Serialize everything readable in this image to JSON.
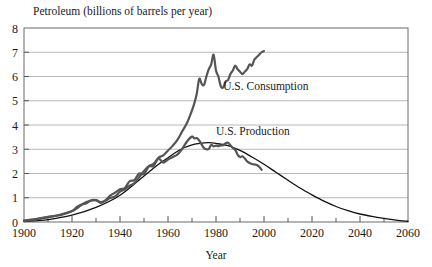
{
  "chart_data": {
    "type": "line",
    "title": "Petroleum (billions of barrels per year)",
    "xlabel": "Year",
    "ylabel": "",
    "xlim": [
      1900,
      2060
    ],
    "ylim": [
      0,
      8
    ],
    "grid": "horizontal",
    "legend_position": "inline-annotations",
    "x_ticks_major": [
      1900,
      1920,
      1940,
      1960,
      1980,
      2000,
      2020,
      2040,
      2060
    ],
    "x_ticks_minor": [
      1910,
      1930,
      1950,
      1970,
      1990,
      2010,
      2030,
      2050
    ],
    "y_ticks": [
      0,
      1,
      2,
      3,
      4,
      5,
      6,
      7,
      8
    ],
    "x_tick_labels": [
      "1900",
      "1920",
      "1940",
      "1960",
      "1980",
      "2000",
      "2020",
      "2040",
      "2060"
    ],
    "y_tick_labels": [
      "0",
      "1",
      "2",
      "3",
      "4",
      "5",
      "6",
      "7",
      "8"
    ],
    "annotations": [
      {
        "text": "U.S. Consumption",
        "x": 1983,
        "y": 5.45
      },
      {
        "text": "U.S. Production",
        "x": 1980,
        "y": 3.6
      }
    ],
    "colors": {
      "consumption": "#555555",
      "production": "#555555",
      "hubbert": "#111111",
      "grid": "#b8b8b8",
      "axis": "#555555",
      "background": "#ffffff"
    },
    "series": [
      {
        "name": "U.S. Consumption",
        "style": "thick-jagged",
        "color": "#555555",
        "x": [
          1900,
          1905,
          1910,
          1915,
          1920,
          1922,
          1924,
          1926,
          1928,
          1930,
          1932,
          1934,
          1936,
          1938,
          1940,
          1942,
          1944,
          1946,
          1948,
          1950,
          1952,
          1954,
          1956,
          1958,
          1960,
          1962,
          1964,
          1966,
          1968,
          1970,
          1971,
          1972,
          1973,
          1974,
          1975,
          1976,
          1977,
          1978,
          1979,
          1980,
          1981,
          1982,
          1983,
          1984,
          1985,
          1986,
          1987,
          1988,
          1989,
          1990,
          1991,
          1992,
          1993,
          1994,
          1995,
          1996,
          1997,
          1998,
          1999,
          2000
        ],
        "y": [
          0.06,
          0.11,
          0.2,
          0.3,
          0.45,
          0.62,
          0.72,
          0.82,
          0.88,
          0.9,
          0.82,
          0.88,
          1.0,
          1.05,
          1.25,
          1.35,
          1.5,
          1.6,
          1.85,
          2.1,
          2.3,
          2.4,
          2.65,
          2.75,
          2.95,
          3.15,
          3.4,
          3.75,
          4.1,
          4.6,
          4.9,
          5.3,
          5.9,
          5.7,
          5.65,
          6.0,
          6.3,
          6.5,
          6.9,
          6.25,
          6.0,
          5.6,
          5.55,
          5.8,
          5.85,
          6.1,
          6.25,
          6.45,
          6.3,
          6.2,
          6.1,
          6.2,
          6.3,
          6.5,
          6.45,
          6.7,
          6.8,
          6.9,
          7.0,
          7.05
        ]
      },
      {
        "name": "U.S. Production",
        "style": "thick-jagged",
        "color": "#555555",
        "x": [
          1900,
          1905,
          1910,
          1915,
          1920,
          1922,
          1924,
          1926,
          1928,
          1930,
          1932,
          1934,
          1936,
          1938,
          1940,
          1942,
          1944,
          1946,
          1948,
          1950,
          1952,
          1954,
          1956,
          1958,
          1960,
          1962,
          1964,
          1966,
          1968,
          1970,
          1971,
          1972,
          1973,
          1974,
          1975,
          1976,
          1977,
          1978,
          1979,
          1980,
          1981,
          1982,
          1983,
          1984,
          1985,
          1986,
          1987,
          1988,
          1989,
          1990,
          1991,
          1992,
          1993,
          1994,
          1995,
          1996,
          1997,
          1998,
          1999
        ],
        "y": [
          0.06,
          0.12,
          0.21,
          0.28,
          0.44,
          0.56,
          0.71,
          0.77,
          0.9,
          0.9,
          0.79,
          0.9,
          1.1,
          1.21,
          1.35,
          1.4,
          1.68,
          1.73,
          2.0,
          1.97,
          2.29,
          2.31,
          2.62,
          2.45,
          2.58,
          2.68,
          2.79,
          3.03,
          3.33,
          3.52,
          3.45,
          3.46,
          3.36,
          3.2,
          3.05,
          3.0,
          3.01,
          3.18,
          3.12,
          3.15,
          3.13,
          3.16,
          3.17,
          3.25,
          3.27,
          3.17,
          3.05,
          2.98,
          2.78,
          2.68,
          2.71,
          2.62,
          2.5,
          2.43,
          2.39,
          2.37,
          2.35,
          2.28,
          2.15
        ]
      },
      {
        "name": "Hubbert curve",
        "style": "thin-smooth",
        "color": "#111111",
        "x": [
          1900,
          1910,
          1920,
          1930,
          1940,
          1950,
          1955,
          1960,
          1965,
          1970,
          1975,
          1977,
          1980,
          1985,
          1990,
          1995,
          2000,
          2005,
          2010,
          2015,
          2020,
          2025,
          2030,
          2035,
          2040,
          2045,
          2050,
          2055,
          2060
        ],
        "y": [
          0.02,
          0.1,
          0.28,
          0.6,
          1.1,
          1.9,
          2.3,
          2.65,
          2.98,
          3.18,
          3.26,
          3.27,
          3.24,
          3.15,
          2.95,
          2.68,
          2.38,
          2.05,
          1.72,
          1.4,
          1.12,
          0.86,
          0.64,
          0.47,
          0.33,
          0.23,
          0.15,
          0.08,
          0.03
        ]
      }
    ]
  }
}
